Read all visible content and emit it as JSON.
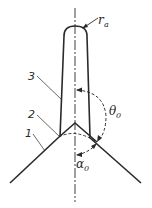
{
  "diagram": {
    "type": "technical-drawing",
    "colors": {
      "line": "#2a2a2a",
      "background": "#ffffff"
    },
    "labels": {
      "radius": "r",
      "radius_sub": "a",
      "part_1": "1",
      "part_2": "2",
      "part_3": "3",
      "angle_theta": "θ",
      "angle_theta_sub": "0",
      "angle_alpha": "α",
      "angle_alpha_sub": "0"
    }
  }
}
